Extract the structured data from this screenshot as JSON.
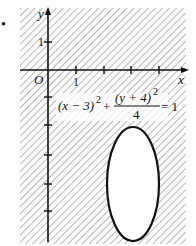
{
  "figure": {
    "marker": "•",
    "axes": {
      "x_label": "x",
      "y_label": "y",
      "origin_label": "O",
      "x_tick_label": "1",
      "y_tick_label": "1",
      "x_ticks": [
        1,
        2,
        3,
        4,
        5
      ],
      "y_ticks": [
        1,
        -1,
        -2,
        -3,
        -4,
        -5,
        -6
      ]
    },
    "equation": {
      "left": "(x − 3)",
      "left_exp": "2",
      "plus": "+",
      "numerator": "(y + 4)",
      "numerator_exp": "2",
      "denominator": "4",
      "equals": "= 1"
    },
    "ellipse": {
      "cx": 3,
      "cy": -4,
      "rx": 1,
      "ry": 2
    },
    "shading": "hatched region outside the ellipse",
    "colors": {
      "ink": "#111111",
      "hatch": "#7a7a7a",
      "background": "#ffffff"
    }
  }
}
